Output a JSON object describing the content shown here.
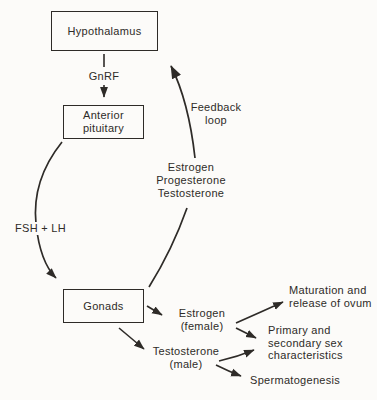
{
  "canvas": {
    "background": "#fcfbf9",
    "ink": "#2e2b28"
  },
  "nodes": {
    "hypothalamus": {
      "label": "Hypothalamus"
    },
    "anterior_pituitary": {
      "line1": "Anterior",
      "line2": "pituitary"
    },
    "gonads": {
      "label": "Gonads"
    }
  },
  "edge_labels": {
    "gnrf": "GnRF",
    "fsh_lh": "FSH + LH",
    "feedback": {
      "line1": "Feedback",
      "line2": "loop"
    },
    "feedback_hormones": {
      "line1": "Estrogen",
      "line2": "Progesterone",
      "line3": "Testosterone"
    }
  },
  "hormones": {
    "estrogen": {
      "line1": "Estrogen",
      "line2": "(female)"
    },
    "testosterone": {
      "line1": "Testosterone",
      "line2": "(male)"
    }
  },
  "outcomes": {
    "maturation": {
      "line1": "Maturation and",
      "line2": "release of ovum"
    },
    "sex_characteristics": {
      "line1": "Primary and",
      "line2": "secondary sex",
      "line3": "characteristics"
    },
    "spermatogenesis": {
      "label": "Spermatogenesis"
    }
  }
}
